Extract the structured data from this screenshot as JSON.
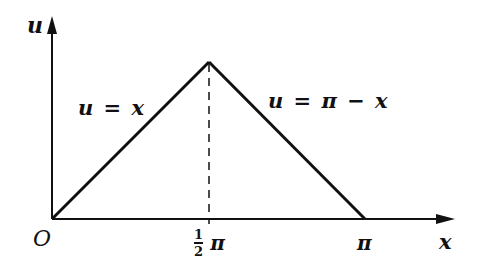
{
  "diagram": {
    "type": "piecewise-linear-graph",
    "colors": {
      "ink": "#111111",
      "background": "#ffffff"
    },
    "axes": {
      "x_label": "x",
      "y_label": "u",
      "origin_label": "O"
    },
    "ticks": {
      "half_pi": {
        "numerator": "1",
        "denominator": "2",
        "symbol": "π"
      },
      "pi": "π"
    },
    "segments": [
      {
        "label": "u = x",
        "from": [
          0,
          0
        ],
        "to": [
          "π/2",
          "π/2"
        ]
      },
      {
        "label": "u = π − x",
        "from": [
          "π/2",
          "π/2"
        ],
        "to": [
          "π",
          0
        ]
      }
    ],
    "dashed_guide": {
      "x": "π/2",
      "from": 0,
      "to": "π/2"
    }
  }
}
